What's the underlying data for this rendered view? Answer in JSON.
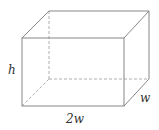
{
  "diagram": {
    "type": "rectangular-box",
    "labels": {
      "height": "h",
      "depth": "w",
      "length": "2w"
    },
    "colors": {
      "line": "#7a7a7a",
      "hidden_line": "#9a9a9a",
      "background": "#ffffff"
    }
  }
}
